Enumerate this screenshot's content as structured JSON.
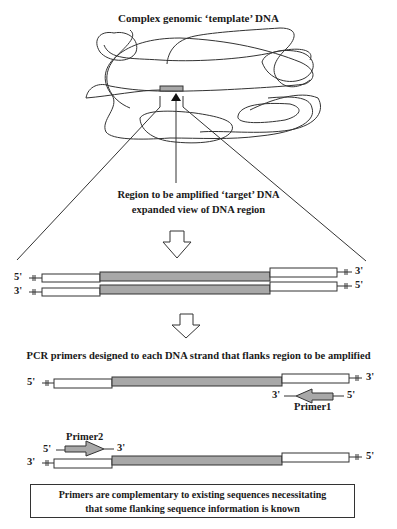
{
  "diagram": {
    "title": "Complex genomic ‘template’ DNA",
    "region_label_line1": "Region to be amplified ‘target’ DNA",
    "region_label_line2": "expanded view of DNA region",
    "pcr_label": "PCR primers designed to each DNA strand that flanks region to be amplified",
    "note": "Primers are complementary to existing sequences necessitating that some flanking sequence information is known",
    "note_line1": "Primers are complementary to existing sequences necessitating",
    "note_line2": "that some flanking sequence information is known",
    "colors": {
      "target_region": "#a8a8a8",
      "strand_fill": "#ffffff",
      "outline": "#333333",
      "primer_fill": "#a8a8a8"
    },
    "double_strand": {
      "top": {
        "left_end": "5'",
        "right_end": "3'"
      },
      "bottom": {
        "left_end": "3'",
        "right_end": "5'"
      }
    },
    "primer1": {
      "label": "Primer1",
      "left_end": "3'",
      "right_end": "5'",
      "direction": "left",
      "strand": {
        "left_end": "5'",
        "right_end": "3'"
      }
    },
    "primer2": {
      "label": "Primer2",
      "left_end": "5'",
      "right_end": "3'",
      "direction": "right",
      "strand": {
        "left_end": "3'",
        "right_end": "5'"
      }
    }
  }
}
